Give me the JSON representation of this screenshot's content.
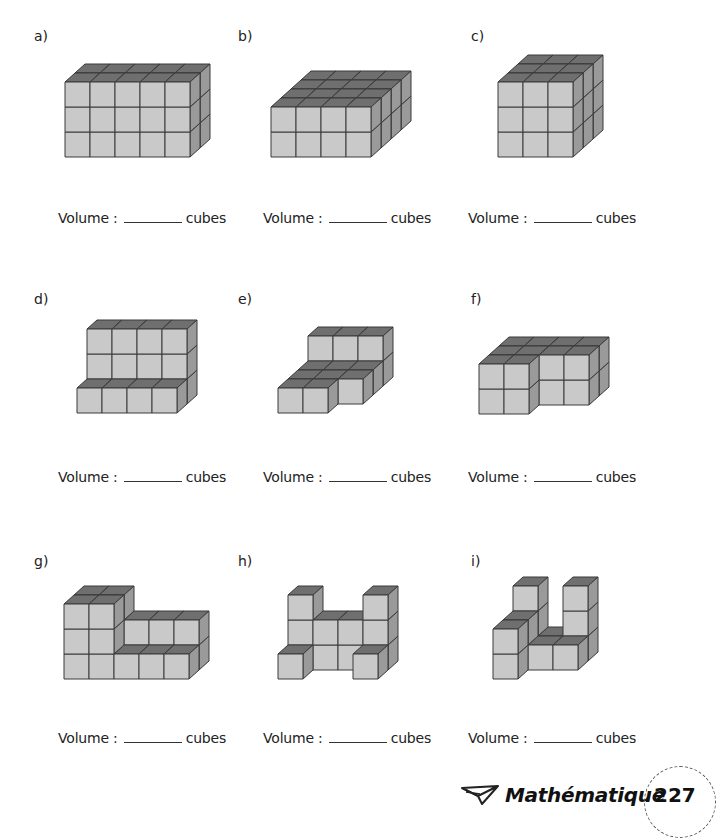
{
  "exercises": [
    {
      "id": "a",
      "label": "a)",
      "label_pos": [
        34,
        28
      ],
      "volume_pos": [
        58,
        210
      ],
      "origin": [
        65,
        157
      ],
      "cubes": [
        [
          0,
          0,
          0
        ],
        [
          1,
          0,
          0
        ],
        [
          2,
          0,
          0
        ],
        [
          3,
          0,
          0
        ],
        [
          4,
          0,
          0
        ],
        [
          0,
          0,
          1
        ],
        [
          1,
          0,
          1
        ],
        [
          2,
          0,
          1
        ],
        [
          3,
          0,
          1
        ],
        [
          4,
          0,
          1
        ],
        [
          0,
          0,
          2
        ],
        [
          1,
          0,
          2
        ],
        [
          2,
          0,
          2
        ],
        [
          3,
          0,
          2
        ],
        [
          4,
          0,
          2
        ],
        [
          0,
          1,
          0
        ],
        [
          1,
          1,
          0
        ],
        [
          2,
          1,
          0
        ],
        [
          3,
          1,
          0
        ],
        [
          4,
          1,
          0
        ],
        [
          0,
          1,
          1
        ],
        [
          1,
          1,
          1
        ],
        [
          2,
          1,
          1
        ],
        [
          3,
          1,
          1
        ],
        [
          4,
          1,
          1
        ],
        [
          0,
          1,
          2
        ],
        [
          1,
          1,
          2
        ],
        [
          2,
          1,
          2
        ],
        [
          3,
          1,
          2
        ],
        [
          4,
          1,
          2
        ]
      ]
    },
    {
      "id": "b",
      "label": "b)",
      "label_pos": [
        238,
        28
      ],
      "volume_pos": [
        263,
        210
      ],
      "origin": [
        271,
        157
      ],
      "dims": [
        4,
        4,
        2
      ]
    },
    {
      "id": "c",
      "label": "c)",
      "label_pos": [
        471,
        28
      ],
      "volume_pos": [
        468,
        210
      ],
      "origin": [
        498,
        157
      ],
      "dims": [
        3,
        3,
        3
      ]
    },
    {
      "id": "d",
      "label": "d)",
      "label_pos": [
        34,
        291
      ],
      "volume_pos": [
        58,
        469
      ],
      "origin": [
        77,
        413
      ],
      "cubes": [
        [
          0,
          0,
          0
        ],
        [
          1,
          0,
          0
        ],
        [
          2,
          0,
          0
        ],
        [
          3,
          0,
          0
        ],
        [
          0,
          1,
          0
        ],
        [
          1,
          1,
          0
        ],
        [
          2,
          1,
          0
        ],
        [
          3,
          1,
          0
        ],
        [
          0,
          1,
          1
        ],
        [
          1,
          1,
          1
        ],
        [
          2,
          1,
          1
        ],
        [
          3,
          1,
          1
        ],
        [
          0,
          1,
          2
        ],
        [
          1,
          1,
          2
        ],
        [
          2,
          1,
          2
        ],
        [
          3,
          1,
          2
        ]
      ]
    },
    {
      "id": "e",
      "label": "e)",
      "label_pos": [
        238,
        291
      ],
      "volume_pos": [
        263,
        469
      ],
      "origin": [
        278,
        413
      ],
      "cubes": [
        [
          0,
          0,
          0
        ],
        [
          1,
          0,
          0
        ],
        [
          0,
          1,
          0
        ],
        [
          1,
          1,
          0
        ],
        [
          2,
          1,
          0
        ],
        [
          0,
          2,
          0
        ],
        [
          1,
          2,
          0
        ],
        [
          2,
          2,
          0
        ],
        [
          0,
          3,
          0
        ],
        [
          1,
          3,
          0
        ],
        [
          2,
          3,
          0
        ],
        [
          0,
          3,
          1
        ],
        [
          1,
          3,
          1
        ],
        [
          2,
          3,
          1
        ]
      ]
    },
    {
      "id": "f",
      "label": "f)",
      "label_pos": [
        471,
        291
      ],
      "volume_pos": [
        468,
        469
      ],
      "origin": [
        479,
        414
      ],
      "cubes": [
        [
          0,
          0,
          0
        ],
        [
          1,
          0,
          0
        ],
        [
          0,
          0,
          1
        ],
        [
          1,
          0,
          1
        ],
        [
          0,
          1,
          0
        ],
        [
          1,
          1,
          0
        ],
        [
          2,
          1,
          0
        ],
        [
          3,
          1,
          0
        ],
        [
          0,
          1,
          1
        ],
        [
          1,
          1,
          1
        ],
        [
          2,
          1,
          1
        ],
        [
          3,
          1,
          1
        ],
        [
          0,
          2,
          0
        ],
        [
          1,
          2,
          0
        ],
        [
          2,
          2,
          0
        ],
        [
          3,
          2,
          0
        ],
        [
          0,
          2,
          1
        ],
        [
          1,
          2,
          1
        ],
        [
          2,
          2,
          1
        ],
        [
          3,
          2,
          1
        ]
      ]
    },
    {
      "id": "g",
      "label": "g)",
      "label_pos": [
        34,
        553
      ],
      "volume_pos": [
        58,
        730
      ],
      "origin": [
        64,
        679
      ],
      "cubes": [
        [
          0,
          0,
          0
        ],
        [
          1,
          0,
          0
        ],
        [
          2,
          0,
          0
        ],
        [
          3,
          0,
          0
        ],
        [
          4,
          0,
          0
        ],
        [
          0,
          0,
          1
        ],
        [
          1,
          0,
          1
        ],
        [
          0,
          0,
          2
        ],
        [
          1,
          0,
          2
        ],
        [
          0,
          1,
          0
        ],
        [
          1,
          1,
          0
        ],
        [
          2,
          1,
          0
        ],
        [
          3,
          1,
          0
        ],
        [
          4,
          1,
          0
        ],
        [
          0,
          1,
          1
        ],
        [
          1,
          1,
          1
        ],
        [
          2,
          1,
          1
        ],
        [
          3,
          1,
          1
        ],
        [
          4,
          1,
          1
        ],
        [
          0,
          1,
          2
        ],
        [
          1,
          1,
          2
        ]
      ]
    },
    {
      "id": "h",
      "label": "h)",
      "label_pos": [
        238,
        553
      ],
      "volume_pos": [
        263,
        730
      ],
      "origin": [
        278,
        679
      ],
      "cubes": [
        [
          0,
          0,
          0
        ],
        [
          3,
          0,
          0
        ],
        [
          0,
          1,
          0
        ],
        [
          0,
          1,
          1
        ],
        [
          0,
          1,
          2
        ],
        [
          1,
          1,
          0
        ],
        [
          1,
          1,
          1
        ],
        [
          2,
          1,
          0
        ],
        [
          2,
          1,
          1
        ],
        [
          3,
          1,
          0
        ],
        [
          3,
          1,
          1
        ],
        [
          3,
          1,
          2
        ]
      ]
    },
    {
      "id": "i",
      "label": "i)",
      "label_pos": [
        471,
        553
      ],
      "volume_pos": [
        468,
        730
      ],
      "origin": [
        493,
        679
      ],
      "cubes": [
        [
          0,
          0,
          0
        ],
        [
          0,
          0,
          1
        ],
        [
          0,
          1,
          0
        ],
        [
          0,
          1,
          1
        ],
        [
          1,
          1,
          0
        ],
        [
          2,
          1,
          0
        ],
        [
          0,
          2,
          0
        ],
        [
          0,
          2,
          1
        ],
        [
          0,
          2,
          2
        ],
        [
          1,
          2,
          0
        ],
        [
          2,
          2,
          0
        ],
        [
          2,
          2,
          1
        ],
        [
          2,
          2,
          2
        ]
      ]
    }
  ],
  "volume_text": {
    "prefix": "Volume :",
    "suffix": "cubes"
  },
  "footer": {
    "subject": "Mathématique",
    "page_number": "227"
  },
  "colors": {
    "front": "#c9c9c9",
    "top": "#6f6f6f",
    "side": "#9a9a9a",
    "edge": "#3a3a3a"
  },
  "geometry": {
    "cube": 25,
    "depth_dx": 10,
    "depth_dy": -9
  }
}
